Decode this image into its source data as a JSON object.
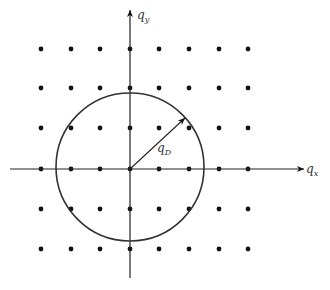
{
  "diagram": {
    "axes": {
      "x_label": "q",
      "x_sub": "x",
      "y_label": "q",
      "y_sub": "y"
    },
    "radius_label": "q",
    "radius_sub": "D",
    "lattice": {
      "columns": [
        41,
        71,
        100,
        130,
        159,
        189,
        219,
        248
      ],
      "rows": [
        49,
        88,
        128,
        169,
        209,
        249
      ]
    },
    "circle": {
      "cx": 130,
      "cy": 167,
      "r": 74
    },
    "colors": {
      "ink": "#111111",
      "circle": "#333333"
    }
  }
}
